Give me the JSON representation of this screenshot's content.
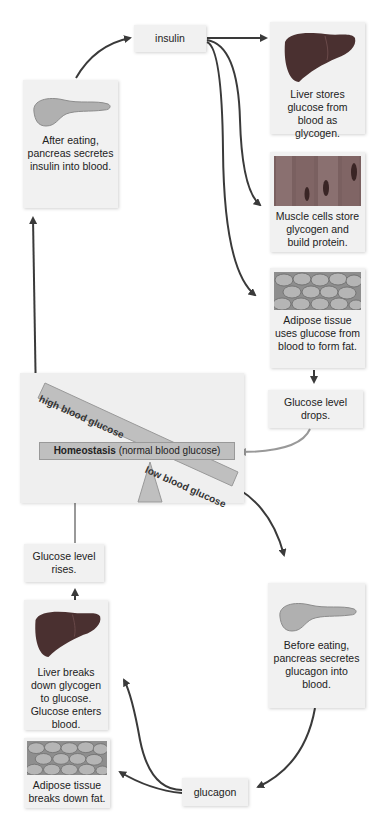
{
  "diagram": {
    "colors": {
      "box_bg": "#f1f1f1",
      "arrow_dark": "#3a3a3a",
      "arrow_light": "#999999",
      "seesaw_bar": "#bfbfbf",
      "liver": "#4a3030",
      "pancreas": "#b0b0b0"
    },
    "top_cycle": {
      "pancreas_box": {
        "icon": "pancreas-icon",
        "text": "After eating, pancreas secretes insulin into blood."
      },
      "hormone": "insulin",
      "targets": [
        {
          "icon": "liver-icon",
          "text": "Liver stores glucose from blood as glycogen."
        },
        {
          "icon": "muscle-icon",
          "text": "Muscle cells store glycogen and build protein."
        },
        {
          "icon": "adipose-icon",
          "text": "Adipose tissue uses glucose from blood to form fat."
        }
      ],
      "result": "Glucose level drops."
    },
    "seesaw": {
      "high_label": "high blood glucose",
      "low_label": "low blood glucose",
      "center_bold": "Homeostasis",
      "center_rest": " (normal blood glucose)"
    },
    "bottom_cycle": {
      "pancreas_box": {
        "icon": "pancreas-icon",
        "text": "Before eating, pancreas secretes glucagon into blood."
      },
      "hormone": "glucagon",
      "targets": [
        {
          "icon": "liver-icon",
          "text": "Liver breaks down glycogen to glucose. Glucose enters blood."
        },
        {
          "icon": "adipose-icon",
          "text": "Adipose tissue breaks down fat."
        }
      ],
      "result": "Glucose level rises."
    }
  }
}
